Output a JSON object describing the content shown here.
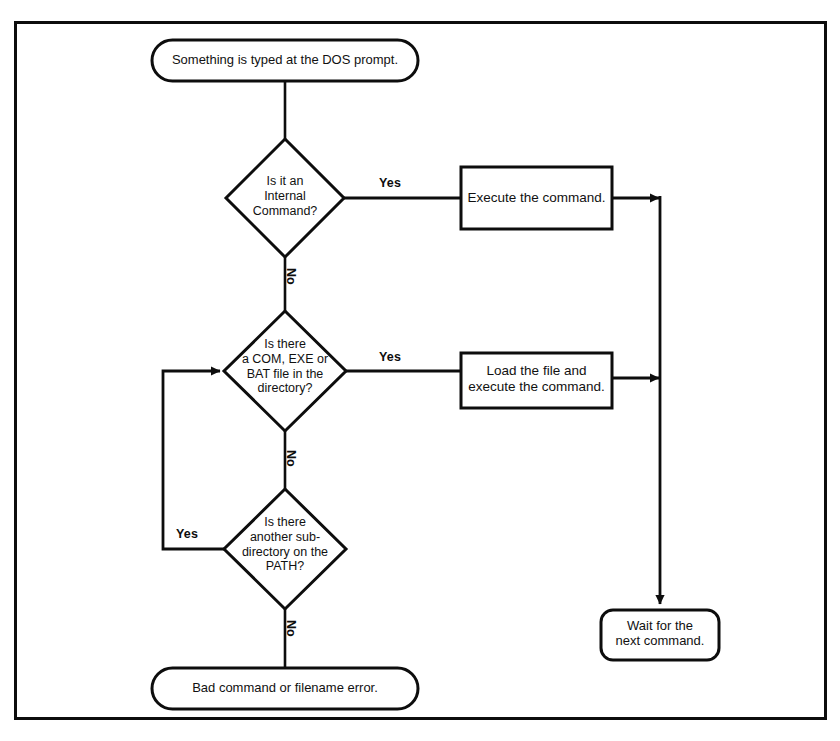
{
  "diagram": {
    "stroke_color": "#0d0d0d",
    "fill_color": "#ffffff",
    "background_color": "#ffffff"
  },
  "nodes": {
    "start": {
      "type": "terminator",
      "text": "Something is typed at the DOS prompt."
    },
    "decision_internal": {
      "type": "decision",
      "text": "Is it an\nInternal\nCommand?"
    },
    "process_execute": {
      "type": "process",
      "text": "Execute the command."
    },
    "decision_file": {
      "type": "decision",
      "text": "Is there\na COM, EXE or\nBAT file in the\ndirectory?"
    },
    "process_load": {
      "type": "process",
      "text": "Load the file and\nexecute the command."
    },
    "decision_path": {
      "type": "decision",
      "text": "Is there\nanother sub-\ndirectory on the\nPATH?"
    },
    "terminator_error": {
      "type": "terminator",
      "text": "Bad command or filename error."
    },
    "terminator_wait": {
      "type": "terminator",
      "text": "Wait for the\nnext command."
    }
  },
  "edge_labels": {
    "internal_yes": "Yes",
    "internal_no": "No",
    "file_yes": "Yes",
    "file_no": "No",
    "path_yes": "Yes",
    "path_no": "No"
  }
}
